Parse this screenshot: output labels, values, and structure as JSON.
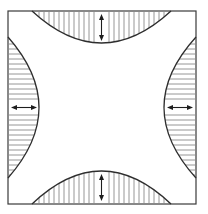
{
  "diagram": {
    "colors": {
      "background": "#ffffff",
      "outline": "#2e2e2e",
      "hatch": "#8a8a8a",
      "arrow": "#1e1e1e"
    },
    "frame": {
      "x": 8,
      "y": 11,
      "width": 188,
      "height": 193
    },
    "regions": [
      {
        "name": "top",
        "hatch": "vertical",
        "arrow": "vertical-double"
      },
      {
        "name": "bottom",
        "hatch": "vertical",
        "arrow": "vertical-double"
      },
      {
        "name": "left",
        "hatch": "horizontal",
        "arrow": "horizontal-double"
      },
      {
        "name": "right",
        "hatch": "horizontal",
        "arrow": "horizontal-double"
      }
    ]
  }
}
